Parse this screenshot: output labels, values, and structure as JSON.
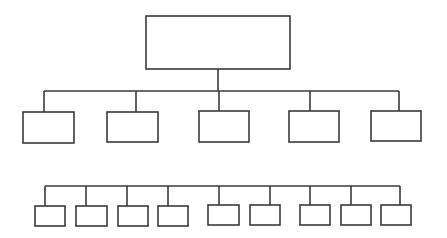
{
  "diagram": {
    "type": "org-chart",
    "levels": 3,
    "colors": {
      "stroke": "#3a3a3a",
      "fill": "#ffffff",
      "background": "#ffffff"
    },
    "root": {
      "label": "",
      "box": {
        "x": 146,
        "y": 16,
        "w": 144,
        "h": 53
      }
    },
    "level1_bus": {
      "y": 91,
      "x1": 44,
      "x2": 399
    },
    "level1": [
      {
        "label": "",
        "drop_x": 44,
        "box": {
          "x": 23,
          "y": 112,
          "w": 51,
          "h": 31
        }
      },
      {
        "label": "",
        "drop_x": 136,
        "box": {
          "x": 107,
          "y": 112,
          "w": 51,
          "h": 30
        }
      },
      {
        "label": "",
        "drop_x": 219,
        "box": {
          "x": 199,
          "y": 111,
          "w": 50,
          "h": 31
        }
      },
      {
        "label": "",
        "drop_x": 310,
        "box": {
          "x": 289,
          "y": 111,
          "w": 50,
          "h": 31
        }
      },
      {
        "label": "",
        "drop_x": 399,
        "box": {
          "x": 371,
          "y": 111,
          "w": 50,
          "h": 30
        }
      }
    ],
    "level2_bus": {
      "y": 186,
      "x1": 45,
      "x2": 400
    },
    "level2": [
      {
        "label": "",
        "drop_x": 45,
        "box": {
          "x": 35,
          "y": 206,
          "w": 30,
          "h": 20
        }
      },
      {
        "label": "",
        "drop_x": 86,
        "box": {
          "x": 76,
          "y": 206,
          "w": 31,
          "h": 20
        }
      },
      {
        "label": "",
        "drop_x": 127,
        "box": {
          "x": 118,
          "y": 206,
          "w": 30,
          "h": 20
        }
      },
      {
        "label": "",
        "drop_x": 168,
        "box": {
          "x": 158,
          "y": 206,
          "w": 30,
          "h": 20
        }
      },
      {
        "label": "",
        "drop_x": 219,
        "box": {
          "x": 208,
          "y": 205,
          "w": 31,
          "h": 20
        }
      },
      {
        "label": "",
        "drop_x": 270,
        "box": {
          "x": 250,
          "y": 205,
          "w": 30,
          "h": 20
        }
      },
      {
        "label": "",
        "drop_x": 310,
        "box": {
          "x": 300,
          "y": 205,
          "w": 30,
          "h": 20
        }
      },
      {
        "label": "",
        "drop_x": 351,
        "box": {
          "x": 341,
          "y": 205,
          "w": 30,
          "h": 20
        }
      },
      {
        "label": "",
        "drop_x": 400,
        "box": {
          "x": 381,
          "y": 205,
          "w": 30,
          "h": 20
        }
      }
    ]
  }
}
